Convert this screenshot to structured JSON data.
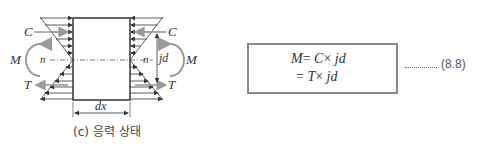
{
  "figure": {
    "caption": "(c) 응력 상태",
    "labels": {
      "compression_left": "C",
      "compression_right": "C",
      "moment_left": "M",
      "moment_right": "M",
      "neutral_left": "n",
      "neutral_right": "n",
      "tension_left": "T",
      "tension_right": "T",
      "lever_arm": "jd",
      "width": "dx"
    },
    "colors": {
      "line": "#333333",
      "force_arrow": "#9a9a9a",
      "box_border": "#8a8a8a"
    }
  },
  "equation": {
    "line1": {
      "lhs": "M",
      "eq": "=",
      "term": "C",
      "op": "×",
      "arm": "jd"
    },
    "line2": {
      "eq": "=",
      "term": "T",
      "op": "×",
      "arm": "jd"
    },
    "leader": "............",
    "number": "(8.8)"
  }
}
